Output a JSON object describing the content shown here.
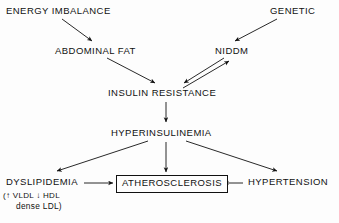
{
  "diagram": {
    "type": "flowchart",
    "background_color": "#fdfdfd",
    "line_color": "#111111",
    "text_color": "#111111",
    "nodes": [
      {
        "id": "energy_imbalance",
        "label": "ENERGY IMBALANCE",
        "boxed": false
      },
      {
        "id": "genetic",
        "label": "GENETIC",
        "boxed": false
      },
      {
        "id": "abdominal_fat",
        "label": "ABDOMINAL FAT",
        "boxed": false
      },
      {
        "id": "niddm",
        "label": "NIDDM",
        "boxed": false
      },
      {
        "id": "insulin_resistance",
        "label": "INSULIN RESISTANCE",
        "boxed": false
      },
      {
        "id": "hyperinsulinemia",
        "label": "HYPERINSULINEMIA",
        "boxed": false
      },
      {
        "id": "dyslipidemia",
        "label": "DYSLIPIDEMIA",
        "boxed": false
      },
      {
        "id": "atherosclerosis",
        "label": "ATHEROSCLEROSIS",
        "boxed": true
      },
      {
        "id": "hypertension",
        "label": "HYPERTENSION",
        "boxed": false
      }
    ],
    "annotations": {
      "dyslipidemia_detail_line1": "(↑ VLDL ↓ HDL",
      "dyslipidemia_detail_line2": "dense LDL)"
    },
    "edges": [
      {
        "from": "energy_imbalance",
        "to": "abdominal_fat",
        "style": "single"
      },
      {
        "from": "genetic",
        "to": "niddm",
        "style": "single"
      },
      {
        "from": "abdominal_fat",
        "to": "insulin_resistance",
        "style": "single"
      },
      {
        "from": "niddm",
        "to": "insulin_resistance",
        "style": "bidirectional-pair"
      },
      {
        "from": "insulin_resistance",
        "to": "niddm",
        "style": "bidirectional-pair"
      },
      {
        "from": "insulin_resistance",
        "to": "hyperinsulinemia",
        "style": "single"
      },
      {
        "from": "hyperinsulinemia",
        "to": "dyslipidemia",
        "style": "single"
      },
      {
        "from": "hyperinsulinemia",
        "to": "atherosclerosis",
        "style": "single"
      },
      {
        "from": "hyperinsulinemia",
        "to": "hypertension",
        "style": "single"
      },
      {
        "from": "dyslipidemia",
        "to": "atherosclerosis",
        "style": "single"
      },
      {
        "from": "hypertension",
        "to": "atherosclerosis",
        "style": "single"
      }
    ]
  }
}
